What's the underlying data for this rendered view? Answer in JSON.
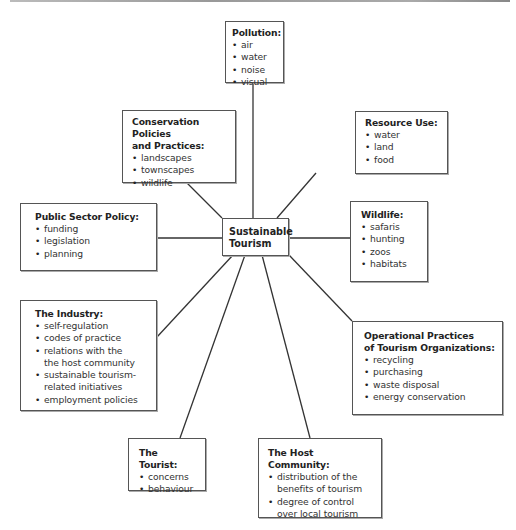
{
  "diagram": {
    "center": {
      "title_line1": "Sustainable",
      "title_line2": "Tourism"
    },
    "nodes": [
      {
        "id": "pollution",
        "title": "Pollution:",
        "items": [
          "air",
          "water",
          "noise",
          "visual"
        ]
      },
      {
        "id": "conservation",
        "title": "Conservation Policies",
        "title2": "and Practices:",
        "items": [
          "landscapes",
          "townscapes",
          "wildlife"
        ]
      },
      {
        "id": "resource-use",
        "title": "Resource Use:",
        "items": [
          "water",
          "land",
          "food"
        ]
      },
      {
        "id": "public-sector",
        "title": "Public Sector Policy:",
        "items": [
          "funding",
          "legislation",
          "planning"
        ]
      },
      {
        "id": "wildlife",
        "title": "Wildlife:",
        "items": [
          "safaris",
          "hunting",
          "zoos",
          "habitats"
        ]
      },
      {
        "id": "industry",
        "title": "The Industry:",
        "items": [
          "self-regulation",
          "codes of practice",
          "relations with the",
          "sustainable tourism-",
          "employment policies"
        ],
        "continuations": [
          "the host community",
          "related initiatives"
        ]
      },
      {
        "id": "operational",
        "title": "Operational Practices",
        "title2": "of Tourism Organizations:",
        "items": [
          "recycling",
          "purchasing",
          "waste disposal",
          "energy conservation"
        ]
      },
      {
        "id": "tourist",
        "title": "The Tourist:",
        "items": [
          "concerns",
          "behaviour"
        ]
      },
      {
        "id": "host-community",
        "title": "The Host Community:",
        "items": [
          "distribution of the",
          "degree of control"
        ],
        "continuations": [
          "benefits of tourism",
          "over local tourism"
        ]
      }
    ]
  }
}
